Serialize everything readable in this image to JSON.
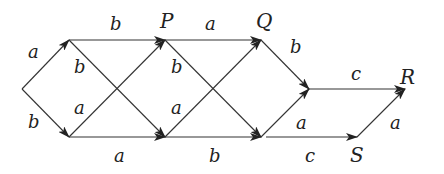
{
  "diagram": {
    "type": "directed-graph",
    "nodes": [
      {
        "id": "start",
        "label": "",
        "x": 22,
        "y": 89
      },
      {
        "id": "n1",
        "label": "",
        "x": 69,
        "y": 40
      },
      {
        "id": "n2",
        "label": "",
        "x": 69,
        "y": 137
      },
      {
        "id": "P",
        "label": "P",
        "x": 165,
        "y": 40,
        "lx": 160,
        "ly": 28
      },
      {
        "id": "n4",
        "label": "",
        "x": 165,
        "y": 137
      },
      {
        "id": "Q",
        "label": "Q",
        "x": 261,
        "y": 40,
        "lx": 256,
        "ly": 28
      },
      {
        "id": "n6",
        "label": "",
        "x": 261,
        "y": 137
      },
      {
        "id": "n7",
        "label": "",
        "x": 309,
        "y": 89
      },
      {
        "id": "R",
        "label": "R",
        "x": 405,
        "y": 89,
        "lx": 400,
        "ly": 84
      },
      {
        "id": "S",
        "label": "S",
        "x": 357,
        "y": 137,
        "lx": 350,
        "ly": 162
      }
    ],
    "edges": [
      {
        "from": "start",
        "to": "n1",
        "label": "a",
        "lx": 28,
        "ly": 58
      },
      {
        "from": "start",
        "to": "n2",
        "label": "b",
        "lx": 28,
        "ly": 128
      },
      {
        "from": "n1",
        "to": "P",
        "label": "b",
        "lx": 110,
        "ly": 30
      },
      {
        "from": "n1",
        "to": "n4",
        "label": "b",
        "lx": 74,
        "ly": 73
      },
      {
        "from": "n2",
        "to": "P",
        "label": "a",
        "lx": 74,
        "ly": 114
      },
      {
        "from": "n2",
        "to": "n4",
        "label": "a",
        "lx": 114,
        "ly": 162
      },
      {
        "from": "P",
        "to": "Q",
        "label": "a",
        "lx": 205,
        "ly": 30
      },
      {
        "from": "P",
        "to": "n6",
        "label": "b",
        "lx": 171,
        "ly": 73
      },
      {
        "from": "n4",
        "to": "Q",
        "label": "a",
        "lx": 171,
        "ly": 114
      },
      {
        "from": "n4",
        "to": "n6",
        "label": "b",
        "lx": 209,
        "ly": 162
      },
      {
        "from": "Q",
        "to": "n7",
        "label": "b",
        "lx": 290,
        "ly": 53
      },
      {
        "from": "n6",
        "to": "n7",
        "label": "a",
        "lx": 296,
        "ly": 129
      },
      {
        "from": "n6",
        "to": "S",
        "label": "c",
        "lx": 305,
        "ly": 162,
        "x1": 266
      },
      {
        "from": "n7",
        "to": "R",
        "label": "c",
        "lx": 351,
        "ly": 80
      },
      {
        "from": "S",
        "to": "R",
        "label": "a",
        "lx": 390,
        "ly": 129
      }
    ]
  }
}
